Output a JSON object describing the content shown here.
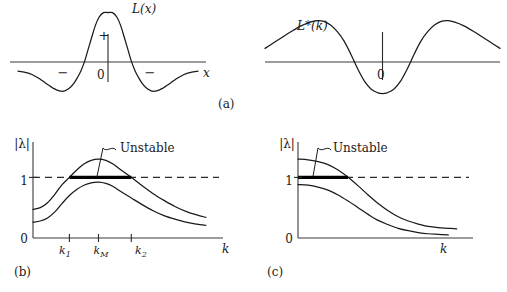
{
  "figure": {
    "width": 507,
    "height": 292,
    "background": "#ffffff",
    "ink": "#1a1a1a"
  },
  "captions": {
    "a": "(a)",
    "b": "(b)",
    "c": "(c)"
  },
  "chart_data": [
    {
      "id": "panel-a-left",
      "type": "line",
      "title": "",
      "curve_label": "L(x)",
      "xlabel": "x",
      "ylabel": "",
      "origin_label": "0",
      "region_labels": [
        {
          "text": "+",
          "where": "central-positive-lobe"
        },
        {
          "text": "−",
          "where": "left-negative-lobe"
        },
        {
          "text": "−",
          "where": "right-negative-lobe"
        }
      ],
      "description": "Mexican-hat / Laplacian-of-Gaussian kernel L(x): positive central lobe flanked by two negative lobes, decaying to zero.",
      "axis": {
        "x_range": [
          -5.0,
          5.0
        ],
        "y_range": [
          -0.42,
          1.08
        ],
        "grid": false
      },
      "x": [
        -5.0,
        -4.6,
        -4.2,
        -3.8,
        -3.4,
        -3.0,
        -2.7,
        -2.4,
        -2.1,
        -1.9,
        -1.7,
        -1.5,
        -1.3,
        -1.1,
        -0.9,
        -0.7,
        -0.5,
        -0.25,
        0.0,
        0.25,
        0.5,
        0.7,
        0.9,
        1.1,
        1.3,
        1.5,
        1.7,
        1.9,
        2.1,
        2.4,
        2.7,
        3.0,
        3.4,
        3.8,
        4.2,
        4.6,
        5.0
      ],
      "y": [
        -0.01,
        -0.03,
        -0.07,
        -0.14,
        -0.23,
        -0.31,
        -0.35,
        -0.35,
        -0.29,
        -0.22,
        -0.12,
        0.0,
        0.16,
        0.37,
        0.58,
        0.78,
        0.92,
        1.0,
        1.0,
        1.0,
        0.92,
        0.78,
        0.58,
        0.37,
        0.16,
        0.0,
        -0.12,
        -0.22,
        -0.29,
        -0.35,
        -0.35,
        -0.31,
        -0.23,
        -0.14,
        -0.07,
        -0.03,
        -0.01
      ]
    },
    {
      "id": "panel-a-right",
      "type": "line",
      "title": "",
      "curve_label": "L*(k)",
      "xlabel": "",
      "ylabel": "",
      "origin_label": "0",
      "description": "Fourier transform L*(k): positive side lobes with a broad negative central trough around k = 0.",
      "axis": {
        "x_range": [
          -5.2,
          5.2
        ],
        "y_range": [
          -0.62,
          0.52
        ],
        "grid": false
      },
      "x": [
        -5.2,
        -4.8,
        -4.4,
        -4.0,
        -3.6,
        -3.2,
        -2.9,
        -2.6,
        -2.3,
        -2.0,
        -1.7,
        -1.4,
        -1.1,
        -0.8,
        -0.5,
        -0.2,
        0.0,
        0.2,
        0.5,
        0.8,
        1.1,
        1.4,
        1.7,
        2.0,
        2.3,
        2.6,
        2.9,
        3.2,
        3.6,
        4.0,
        4.4,
        4.8,
        5.2
      ],
      "y": [
        0.02,
        0.1,
        0.18,
        0.26,
        0.33,
        0.38,
        0.4,
        0.39,
        0.34,
        0.25,
        0.12,
        -0.06,
        -0.26,
        -0.43,
        -0.54,
        -0.59,
        -0.6,
        -0.59,
        -0.54,
        -0.43,
        -0.26,
        -0.06,
        0.12,
        0.25,
        0.34,
        0.39,
        0.4,
        0.38,
        0.33,
        0.26,
        0.18,
        0.1,
        0.02
      ]
    },
    {
      "id": "panel-b",
      "type": "line",
      "title": "",
      "ylabel": "|λ|",
      "xlabel": "k",
      "ytick_labels": [
        "0",
        "1"
      ],
      "ytick_values": [
        0,
        1
      ],
      "xtick_labels": [
        "k₁",
        "k_M",
        "k₂"
      ],
      "xtick_base": [
        "k",
        "k",
        "k"
      ],
      "xtick_sub": [
        "1",
        "M",
        "2"
      ],
      "threshold": 1,
      "threshold_style": "dashed",
      "annotation": "Unstable",
      "unstable_interval_labels": [
        "k₁",
        "k₂"
      ],
      "description": "Amplification factor |lambda| versus wavenumber k. Upper curve rises above the unity threshold between k1 and k2 (band of unstable modes, peak at kM); lower curve stays below unity everywhere.",
      "axis": {
        "x_range": [
          0,
          10
        ],
        "y_range": [
          0,
          1.55
        ],
        "grid": false
      },
      "xticks": [
        2.0,
        3.6,
        5.4
      ],
      "series": [
        {
          "name": "upper-curve",
          "x": [
            0.0,
            0.4,
            0.8,
            1.2,
            1.6,
            2.0,
            2.4,
            2.8,
            3.2,
            3.6,
            4.0,
            4.4,
            4.8,
            5.4,
            6.0,
            6.6,
            7.2,
            7.8,
            8.4,
            9.0,
            9.5
          ],
          "y": [
            0.47,
            0.5,
            0.58,
            0.72,
            0.88,
            1.0,
            1.12,
            1.22,
            1.28,
            1.3,
            1.28,
            1.22,
            1.13,
            1.0,
            0.86,
            0.73,
            0.62,
            0.52,
            0.44,
            0.38,
            0.34
          ]
        },
        {
          "name": "lower-curve",
          "x": [
            0.0,
            0.4,
            0.8,
            1.2,
            1.6,
            2.0,
            2.4,
            2.8,
            3.2,
            3.6,
            4.0,
            4.4,
            4.8,
            5.4,
            6.0,
            6.6,
            7.2,
            7.8,
            8.4,
            9.0,
            9.5
          ],
          "y": [
            0.26,
            0.28,
            0.33,
            0.43,
            0.57,
            0.7,
            0.8,
            0.87,
            0.91,
            0.92,
            0.9,
            0.85,
            0.77,
            0.66,
            0.55,
            0.45,
            0.37,
            0.31,
            0.26,
            0.23,
            0.21
          ]
        }
      ]
    },
    {
      "id": "panel-c",
      "type": "line",
      "title": "",
      "ylabel": "|λ|",
      "xlabel": "k",
      "ytick_labels": [
        "0",
        "1"
      ],
      "ytick_values": [
        0,
        1
      ],
      "xtick_labels": [],
      "threshold": 1,
      "threshold_style": "dashed",
      "annotation": "Unstable",
      "description": "Amplification factor |lambda| versus k for a monotone case. Upper curve starts above unity at k = 0 and decays through the threshold; lower curve starts just below unity and decays to zero.",
      "axis": {
        "x_range": [
          0,
          10
        ],
        "y_range": [
          0,
          1.55
        ],
        "grid": false
      },
      "series": [
        {
          "name": "upper-curve",
          "x": [
            0.0,
            0.6,
            1.2,
            1.8,
            2.4,
            3.0,
            3.6,
            4.2,
            4.8,
            5.4,
            6.0,
            6.6,
            7.2,
            7.8,
            8.4,
            9.0,
            9.5
          ],
          "y": [
            1.3,
            1.29,
            1.26,
            1.21,
            1.12,
            1.0,
            0.86,
            0.71,
            0.57,
            0.45,
            0.35,
            0.28,
            0.23,
            0.19,
            0.17,
            0.16,
            0.15
          ]
        },
        {
          "name": "lower-curve",
          "x": [
            0.0,
            0.6,
            1.2,
            1.8,
            2.4,
            3.0,
            3.6,
            4.2,
            4.8,
            5.4,
            6.0,
            6.6,
            7.2,
            7.8,
            8.4,
            9.0
          ],
          "y": [
            0.88,
            0.87,
            0.84,
            0.79,
            0.71,
            0.61,
            0.5,
            0.39,
            0.29,
            0.22,
            0.16,
            0.12,
            0.09,
            0.07,
            0.06,
            0.05
          ]
        }
      ]
    }
  ]
}
